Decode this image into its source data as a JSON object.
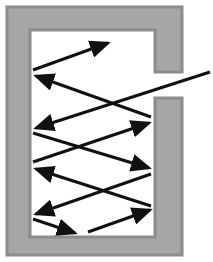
{
  "diagram": {
    "colors": {
      "wall_fill": "#a6a6a6",
      "wall_edge": "#8c8c8c",
      "interior": "#ffffff",
      "ray": "#111111"
    },
    "cavity": {
      "outer": {
        "x": 7,
        "y": 7,
        "w": 175,
        "h": 248
      },
      "inner": {
        "x": 30,
        "y": 30,
        "w": 125,
        "h": 207
      },
      "opening": {
        "y_top": 72,
        "y_bottom": 98
      }
    },
    "rays": [
      {
        "id": "incoming",
        "from": [
          210,
          72
        ],
        "to": [
          36,
          128
        ],
        "arrow": true
      },
      {
        "id": "r1",
        "from": [
          33,
          133
        ],
        "to": [
          149,
          168
        ],
        "arrow": true
      },
      {
        "id": "r2",
        "from": [
          33,
          162
        ],
        "to": [
          149,
          123
        ],
        "arrow": true
      },
      {
        "id": "r3",
        "from": [
          151,
          117
        ],
        "to": [
          36,
          76
        ],
        "arrow": true
      },
      {
        "id": "r4",
        "from": [
          33,
          70
        ],
        "to": [
          108,
          43
        ],
        "arrow": true
      },
      {
        "id": "r5",
        "from": [
          151,
          206
        ],
        "to": [
          36,
          169
        ],
        "arrow": true
      },
      {
        "id": "r6",
        "from": [
          151,
          174
        ],
        "to": [
          36,
          214
        ],
        "arrow": true
      },
      {
        "id": "r7",
        "from": [
          33,
          219
        ],
        "to": [
          75,
          233
        ],
        "arrow": true
      },
      {
        "id": "r8",
        "from": [
          88,
          232
        ],
        "to": [
          150,
          210
        ],
        "arrow": true
      }
    ]
  }
}
